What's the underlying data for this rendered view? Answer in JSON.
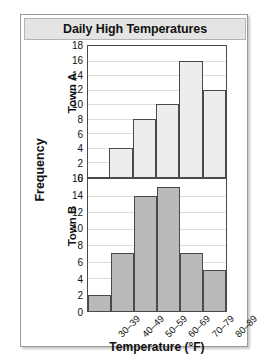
{
  "chart_data": {
    "type": "bar",
    "title": "Daily High Temperatures",
    "xlabel": "Temperature (°F)",
    "ylabel": "Frequency",
    "categories": [
      "30–39",
      "40–49",
      "50–59",
      "60–69",
      "70–79",
      "80–89"
    ],
    "grid": true,
    "legend_position": "none",
    "panels": [
      {
        "name": "Town A",
        "values": [
          0,
          4,
          8,
          10,
          16,
          12
        ],
        "ylim": [
          0,
          18
        ],
        "ytick_step": 2,
        "yticks": [
          18,
          16,
          14,
          12,
          10,
          8,
          6,
          4,
          2,
          0
        ],
        "bar_color": "#ededed",
        "bar_edge_color": "#4a4a4a"
      },
      {
        "name": "Town B",
        "values": [
          2,
          7,
          14,
          15,
          7,
          5
        ],
        "ylim": [
          0,
          16
        ],
        "ytick_step": 2,
        "yticks": [
          16,
          14,
          12,
          10,
          8,
          6,
          4,
          2,
          0
        ],
        "bar_color": "#b9b9b9",
        "bar_edge_color": "#4a4a4a"
      }
    ]
  },
  "card": {
    "title_bar_color": "#e4e4e4",
    "border_color": "#9a9a9a"
  }
}
